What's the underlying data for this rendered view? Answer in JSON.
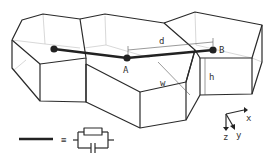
{
  "diagram": {
    "type": "3D prism cell network with RC connection",
    "nodes": [
      {
        "id": "left",
        "label": ""
      },
      {
        "id": "A",
        "label": "A"
      },
      {
        "id": "B",
        "label": "B"
      }
    ],
    "dimensions": {
      "d": "d",
      "w": "w",
      "h": "h"
    },
    "axes": {
      "x": "x",
      "y": "y",
      "z": "z"
    },
    "legend": {
      "equals": "≡",
      "meaning": "connection line equals resistor in parallel with capacitor"
    },
    "colors": {
      "line": "#2a2a2a",
      "hidden": "#bdbdbd",
      "background": "#ffffff"
    }
  }
}
